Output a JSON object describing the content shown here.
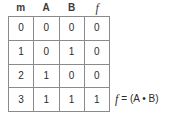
{
  "table": {
    "headers": [
      "m",
      "A",
      "B",
      "f"
    ],
    "rows": [
      {
        "m": "0",
        "A": "0",
        "B": "0",
        "f": "0"
      },
      {
        "m": "1",
        "A": "0",
        "B": "1",
        "f": "0"
      },
      {
        "m": "2",
        "A": "1",
        "B": "0",
        "f": "0"
      },
      {
        "m": "3",
        "A": "1",
        "B": "1",
        "f": "1"
      }
    ]
  },
  "equation": {
    "function_symbol": "f",
    "expression": "= (A • B)",
    "full": "f = (A • B)"
  },
  "colors": {
    "background": "#ffffff",
    "border": "#8a8a8a",
    "text": "#2b2b2b",
    "header_text": "#3a3a3a"
  },
  "chart_data": {
    "type": "table",
    "title": "",
    "columns": [
      "m",
      "A",
      "B",
      "f"
    ],
    "rows": [
      [
        "0",
        "0",
        "0",
        "0"
      ],
      [
        "1",
        "0",
        "1",
        "0"
      ],
      [
        "2",
        "1",
        "0",
        "0"
      ],
      [
        "3",
        "1",
        "1",
        "1"
      ]
    ],
    "annotations": [
      "f = (A • B)"
    ]
  }
}
